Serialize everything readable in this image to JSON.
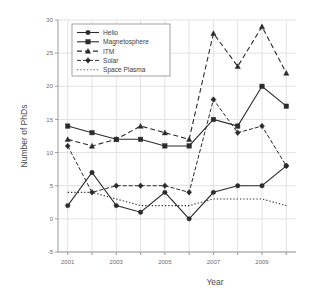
{
  "chart_data": {
    "type": "line",
    "title": "",
    "xlabel": "Year",
    "ylabel": "Number of PhDs",
    "x": [
      2001,
      2002,
      2003,
      2004,
      2005,
      2006,
      2007,
      2008,
      2009,
      2010
    ],
    "xlim": [
      2000.6,
      2010.4
    ],
    "ylim": [
      -5,
      30
    ],
    "yticks": [
      -5,
      0,
      5,
      10,
      15,
      20,
      25,
      30
    ],
    "ytick_labels": [
      "-5",
      "0",
      "5",
      "10",
      "15",
      "20",
      "25",
      "30"
    ],
    "xticks": [
      2001,
      2002,
      2003,
      2004,
      2005,
      2006,
      2007,
      2008,
      2009,
      2010
    ],
    "xtick_labels": [
      "2001",
      "",
      "2003",
      "",
      "2005",
      "",
      "2007",
      "",
      "2009",
      ""
    ],
    "grid": true,
    "legend_position": "top-left",
    "series": [
      {
        "name": "Helio",
        "values": [
          2,
          7,
          2,
          1,
          4,
          0,
          4,
          5,
          5,
          8
        ],
        "line_style": "solid",
        "marker": "circle",
        "color": "#2b2b2d"
      },
      {
        "name": "Magnetosphere",
        "values": [
          14,
          13,
          12,
          12,
          11,
          11,
          15,
          14,
          20,
          17
        ],
        "line_style": "solid",
        "marker": "square",
        "color": "#2b2b2d"
      },
      {
        "name": "ITM",
        "values": [
          12,
          11,
          12,
          14,
          13,
          12,
          28,
          23,
          29,
          22
        ],
        "line_style": "dashed",
        "marker": "triangle",
        "color": "#2b2b2d"
      },
      {
        "name": "Solar",
        "values": [
          11,
          4,
          5,
          5,
          5,
          4,
          18,
          13,
          14,
          8
        ],
        "line_style": "dash-dot",
        "marker": "diamond",
        "color": "#2b2b2d"
      },
      {
        "name": "Space Plasma",
        "values": [
          4,
          4,
          3,
          2,
          2,
          2,
          3,
          3,
          3,
          2
        ],
        "line_style": "dotted",
        "marker": "none",
        "color": "#5c5c5e"
      }
    ]
  },
  "legend": {
    "items": [
      {
        "label": "Helio"
      },
      {
        "label": "Magnetosphere"
      },
      {
        "label": "ITM"
      },
      {
        "label": "Solar"
      },
      {
        "label": "Space Plasma"
      }
    ]
  }
}
